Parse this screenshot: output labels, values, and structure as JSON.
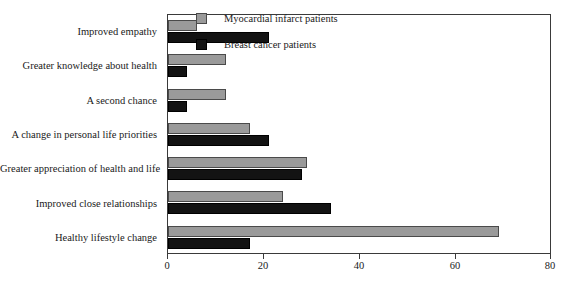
{
  "chart_data": {
    "type": "bar",
    "orientation": "horizontal",
    "title": "",
    "subtitle": "",
    "xlabel": "",
    "ylabel": "",
    "xlim": [
      0,
      80
    ],
    "xticks": [
      0,
      20,
      40,
      60,
      80
    ],
    "xtick_labels": [
      "0",
      "20",
      "40",
      "60",
      "80"
    ],
    "grid": false,
    "legend_position": "top-right",
    "categories": [
      "Improved empathy",
      "Greater knowledge about health",
      "A second chance",
      "A change in personal life priorities",
      "Greater appreciation of health and life",
      "Improved close relationships",
      "Healthy lifestyle change"
    ],
    "series": [
      {
        "name": "Myocardial infarct patients",
        "color": "#9a9a9a",
        "values": [
          6,
          12,
          12,
          17,
          29,
          24,
          69
        ]
      },
      {
        "name": "Breast cancer patients",
        "color": "#131313",
        "values": [
          21,
          4,
          4,
          21,
          28,
          34,
          17
        ]
      }
    ]
  },
  "legend": {
    "items": [
      {
        "label": "Myocardial infarct patients",
        "swatch": "legend-swatch-gray"
      },
      {
        "label": "Breast cancer patients",
        "swatch": "legend-swatch-black"
      }
    ]
  }
}
